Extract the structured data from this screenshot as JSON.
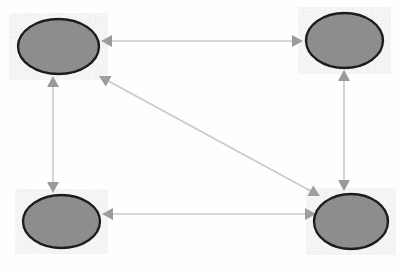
{
  "diagram": {
    "type": "node-link-diagram",
    "background_color": "#fefefe",
    "canvas": {
      "width": 404,
      "height": 270
    },
    "style": {
      "node_fill": "#8d8d8d",
      "node_stroke": "#1e1e1e",
      "node_stroke_width": 2.4,
      "edge_color": "#c9c9c9",
      "edge_width": 1.6,
      "arrowhead_color": "#9a9a9a",
      "arrowhead_length": 11,
      "arrowhead_width": 12
    },
    "nodes": [
      {
        "id": "n1",
        "name": "top-left-node",
        "label": "",
        "cx": 58.5,
        "cy": 46.5,
        "rx": 40.5,
        "ry": 27.5
      },
      {
        "id": "n2",
        "name": "top-right-node",
        "label": "",
        "cx": 344.5,
        "cy": 40.5,
        "rx": 38.5,
        "ry": 27.5
      },
      {
        "id": "n3",
        "name": "bottom-left-node",
        "label": "",
        "cx": 61.5,
        "cy": 221.5,
        "rx": 38.5,
        "ry": 26.5
      },
      {
        "id": "n4",
        "name": "bottom-right-node",
        "label": "",
        "cx": 351.0,
        "cy": 221.5,
        "rx": 37.0,
        "ry": 27.5
      }
    ],
    "edges": [
      {
        "id": "e1",
        "name": "edge-top-horizontal",
        "from": "n1",
        "to": "n2",
        "label": "",
        "directed": "both",
        "x1": 101,
        "y1": 41,
        "x2": 303,
        "y2": 41
      },
      {
        "id": "e2",
        "name": "edge-left-vertical",
        "from": "n1",
        "to": "n3",
        "label": "",
        "directed": "both",
        "x1": 53,
        "y1": 76,
        "x2": 53,
        "y2": 193
      },
      {
        "id": "e3",
        "name": "edge-right-vertical",
        "from": "n2",
        "to": "n4",
        "label": "",
        "directed": "both",
        "x1": 344,
        "y1": 70,
        "x2": 344,
        "y2": 191
      },
      {
        "id": "e4",
        "name": "edge-bottom-horizontal",
        "from": "n4",
        "to": "n3",
        "label": "",
        "directed": "both",
        "x1": 316,
        "y1": 214,
        "x2": 102,
        "y2": 214
      },
      {
        "id": "e5",
        "name": "edge-diagonal",
        "from": "n1",
        "to": "n4",
        "label": "",
        "directed": "both",
        "x1": 99,
        "y1": 76,
        "x2": 320,
        "y2": 196
      }
    ]
  }
}
